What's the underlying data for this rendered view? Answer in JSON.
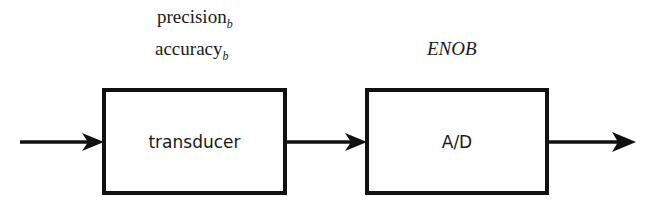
{
  "diagram": {
    "type": "block-diagram",
    "flow_direction": "left-to-right",
    "blocks": [
      {
        "id": "transducer",
        "label": "transducer",
        "annotations": [
          {
            "text": "precision",
            "subscript": "b"
          },
          {
            "text": "accuracy",
            "subscript": "b"
          }
        ]
      },
      {
        "id": "ad",
        "label": "A/D",
        "annotations": [
          {
            "text": "ENOB",
            "subscript": ""
          }
        ]
      }
    ],
    "connections": [
      {
        "from": "input",
        "to": "transducer"
      },
      {
        "from": "transducer",
        "to": "ad"
      },
      {
        "from": "ad",
        "to": "output"
      }
    ],
    "colors": {
      "stroke": "#111111",
      "text": "#1a1a1a",
      "background": "#ffffff"
    }
  }
}
